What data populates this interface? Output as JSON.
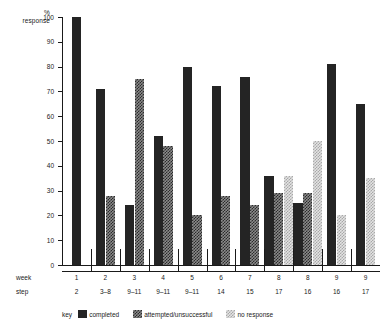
{
  "chart_data": {
    "type": "bar",
    "title": "",
    "subtitle": "",
    "xlabel": "",
    "ylabel": "% response",
    "ylim": [
      0,
      100
    ],
    "ytick_values": [
      0,
      10,
      20,
      30,
      40,
      50,
      60,
      70,
      80,
      90,
      100
    ],
    "ytick_labels": [
      "0",
      "10",
      "20",
      "30",
      "40",
      "50",
      "60",
      "70",
      "80",
      "90",
      "100"
    ],
    "grid": false,
    "legend_position": "bottom-left",
    "legend_title": "key",
    "categories": [
      "1",
      "2",
      "3",
      "4",
      "5",
      "6",
      "7",
      "8",
      "8",
      "9",
      "9"
    ],
    "category_axis_rows": [
      {
        "label": "week",
        "values": [
          "1",
          "2",
          "3",
          "4",
          "5",
          "6",
          "7",
          "8",
          "8",
          "9",
          "9"
        ]
      },
      {
        "label": "step",
        "values": [
          "2",
          "3–8",
          "9–11",
          "9–11",
          "9–11",
          "14",
          "15",
          "17",
          "16",
          "16",
          "17"
        ]
      }
    ],
    "series": [
      {
        "name": "completed",
        "color": "#242424",
        "values": [
          100,
          71,
          24,
          52,
          80,
          72,
          76,
          36,
          25,
          81,
          65
        ]
      },
      {
        "name": "attempted/unsuccessful",
        "color": "#8a8a8a",
        "values": [
          null,
          28,
          75,
          48,
          20,
          28,
          24,
          29,
          29,
          null,
          null
        ]
      },
      {
        "name": "no response",
        "color": "#e3e3e3",
        "values": [
          null,
          null,
          null,
          null,
          null,
          null,
          null,
          36,
          50,
          20,
          35
        ]
      }
    ]
  },
  "legend": {
    "title": "key",
    "items": [
      {
        "label": "completed",
        "swatch": "completed"
      },
      {
        "label": "attempted/unsuccessful",
        "swatch": "attempted"
      },
      {
        "label": "no response",
        "swatch": "noresponse"
      }
    ]
  },
  "axis": {
    "y_title_line1": "%",
    "y_title_line2": "response"
  }
}
